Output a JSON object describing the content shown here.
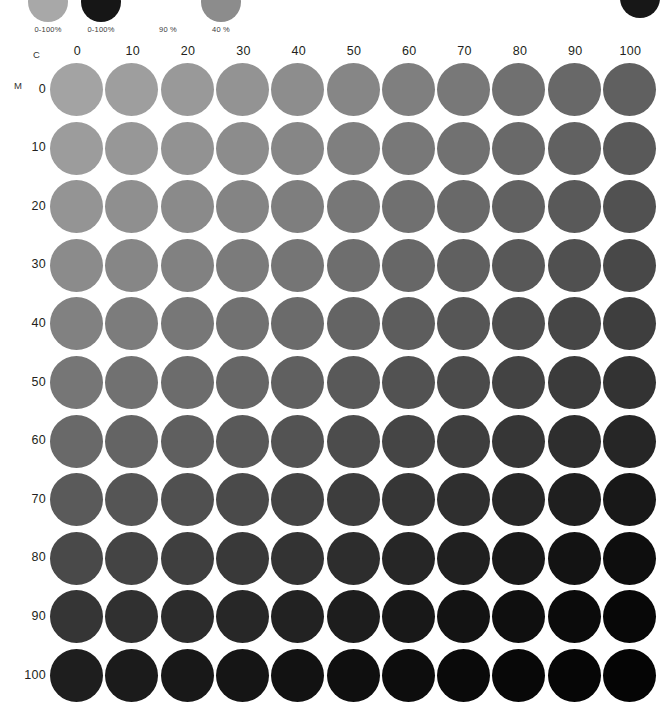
{
  "page": {
    "title": "CMYK Process Color Chart",
    "background": "#ffffff",
    "ink_black": "#231f20"
  },
  "legend": {
    "swatches": [
      {
        "label": "0-100%",
        "color": "#a8a8a8",
        "visible": true
      },
      {
        "label": "0-100%",
        "color": "#161616",
        "visible": true
      },
      {
        "label": "90 %",
        "color": "#ffffff",
        "visible": false
      },
      {
        "label": "40 %",
        "color": "#8c8c8c",
        "visible": true
      }
    ],
    "corner_dot": {
      "name": "corner-dot",
      "color": "#171717"
    }
  },
  "axes": {
    "x_letter": "C",
    "y_letter": "M",
    "x_label": "Cyan",
    "y_label": "Magenta",
    "columns": [
      "0",
      "10",
      "20",
      "30",
      "40",
      "50",
      "60",
      "70",
      "80",
      "90",
      "100"
    ],
    "rows": [
      "0",
      "10",
      "20",
      "30",
      "40",
      "50",
      "60",
      "70",
      "80",
      "90",
      "100"
    ]
  },
  "chart_data": {
    "type": "heatmap",
    "title": "CMYK Process Color Chart",
    "xlabel": "C",
    "ylabel": "M",
    "x": [
      0,
      10,
      20,
      30,
      40,
      50,
      60,
      70,
      80,
      90,
      100
    ],
    "y": [
      0,
      10,
      20,
      30,
      40,
      50,
      60,
      70,
      80,
      90,
      100
    ],
    "xlim": [
      0,
      100
    ],
    "ylim": [
      0,
      100
    ],
    "grid": false,
    "legend_position": "top",
    "marker": "circle",
    "note": "Each cell is a circular swatch of C% cyan + M% magenta over a fixed black/gray base; rendered here in grayscale as printed.",
    "values": [
      [
        163,
        158,
        153,
        147,
        141,
        134,
        127,
        120,
        112,
        104,
        96
      ],
      [
        156,
        151,
        146,
        140,
        134,
        127,
        120,
        113,
        105,
        97,
        89
      ],
      [
        148,
        143,
        138,
        132,
        126,
        119,
        112,
        105,
        97,
        89,
        81
      ],
      [
        139,
        134,
        129,
        123,
        117,
        110,
        103,
        96,
        88,
        80,
        72
      ],
      [
        129,
        124,
        119,
        113,
        107,
        100,
        93,
        86,
        78,
        70,
        62
      ],
      [
        118,
        113,
        108,
        102,
        96,
        89,
        82,
        75,
        67,
        59,
        51
      ],
      [
        105,
        100,
        95,
        89,
        83,
        76,
        69,
        62,
        54,
        46,
        38
      ],
      [
        90,
        85,
        80,
        74,
        68,
        61,
        54,
        47,
        39,
        31,
        24
      ],
      [
        73,
        68,
        63,
        57,
        51,
        45,
        38,
        32,
        25,
        19,
        14
      ],
      [
        53,
        48,
        44,
        39,
        34,
        29,
        24,
        19,
        15,
        11,
        8
      ],
      [
        30,
        27,
        24,
        21,
        18,
        15,
        13,
        10,
        8,
        6,
        5
      ]
    ]
  }
}
